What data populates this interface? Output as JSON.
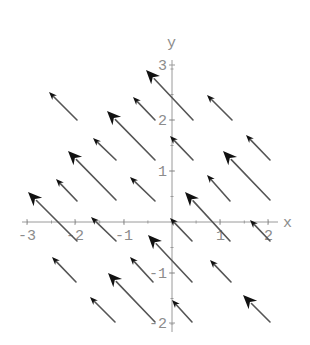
{
  "chart_data": {
    "type": "vector_field",
    "title": "",
    "xlabel": "x",
    "ylabel": "y",
    "xlim": [
      -3,
      2
    ],
    "ylim": [
      -2,
      3
    ],
    "xticks": [
      -3,
      -2,
      -1,
      1,
      2
    ],
    "yticks": [
      -2,
      -1,
      1,
      2,
      3
    ],
    "xtick_labels": [
      "-3",
      "-2",
      "-1",
      "1",
      "2"
    ],
    "ytick_labels": [
      "-2",
      "-1",
      "1",
      "2",
      "3"
    ],
    "grid": false,
    "legend": null,
    "direction": "all vectors point up-left (approx. -1, +1)",
    "arrows_px": [
      {
        "head": [
          49,
          92
        ],
        "tail": [
          77,
          120
        ],
        "size": "small"
      },
      {
        "head": [
          133,
          97
        ],
        "tail": [
          155,
          120
        ],
        "size": "small"
      },
      {
        "head": [
          146,
          70
        ],
        "tail": [
          193,
          120
        ],
        "size": "large"
      },
      {
        "head": [
          207,
          95
        ],
        "tail": [
          232,
          120
        ],
        "size": "small"
      },
      {
        "head": [
          107,
          111
        ],
        "tail": [
          155,
          160
        ],
        "size": "large"
      },
      {
        "head": [
          93,
          138
        ],
        "tail": [
          116,
          160
        ],
        "size": "small"
      },
      {
        "head": [
          170,
          136
        ],
        "tail": [
          193,
          160
        ],
        "size": "small"
      },
      {
        "head": [
          246,
          135
        ],
        "tail": [
          270,
          160
        ],
        "size": "small"
      },
      {
        "head": [
          68,
          151
        ],
        "tail": [
          116,
          200
        ],
        "size": "large"
      },
      {
        "head": [
          223,
          151
        ],
        "tail": [
          270,
          200
        ],
        "size": "large"
      },
      {
        "head": [
          56,
          179
        ],
        "tail": [
          77,
          201
        ],
        "size": "small"
      },
      {
        "head": [
          130,
          177
        ],
        "tail": [
          155,
          201
        ],
        "size": "small"
      },
      {
        "head": [
          207,
          175
        ],
        "tail": [
          230,
          201
        ],
        "size": "small"
      },
      {
        "head": [
          28,
          192
        ],
        "tail": [
          77,
          241
        ],
        "size": "large"
      },
      {
        "head": [
          185,
          192
        ],
        "tail": [
          230,
          241
        ],
        "size": "large"
      },
      {
        "head": [
          91,
          217
        ],
        "tail": [
          116,
          241
        ],
        "size": "small"
      },
      {
        "head": [
          170,
          218
        ],
        "tail": [
          192,
          241
        ],
        "size": "small"
      },
      {
        "head": [
          250,
          220
        ],
        "tail": [
          270,
          241
        ],
        "size": "small"
      },
      {
        "head": [
          148,
          235
        ],
        "tail": [
          192,
          282
        ],
        "size": "large"
      },
      {
        "head": [
          52,
          257
        ],
        "tail": [
          76,
          282
        ],
        "size": "small"
      },
      {
        "head": [
          130,
          257
        ],
        "tail": [
          153,
          282
        ],
        "size": "small"
      },
      {
        "head": [
          210,
          260
        ],
        "tail": [
          231,
          282
        ],
        "size": "small"
      },
      {
        "head": [
          108,
          273
        ],
        "tail": [
          155,
          322
        ],
        "size": "large"
      },
      {
        "head": [
          90,
          297
        ],
        "tail": [
          115,
          322
        ],
        "size": "small"
      },
      {
        "head": [
          172,
          300
        ],
        "tail": [
          192,
          322
        ],
        "size": "small"
      },
      {
        "head": [
          243,
          295
        ],
        "tail": [
          270,
          322
        ],
        "size": "large"
      }
    ]
  },
  "axes": {
    "x_label": "x",
    "y_label": "y",
    "x_ticks": [
      {
        "label": "-3",
        "px": 27
      },
      {
        "label": "-2",
        "px": 75
      },
      {
        "label": "-1",
        "px": 124
      },
      {
        "label": "1",
        "px": 220
      },
      {
        "label": "2",
        "px": 268
      }
    ],
    "y_ticks": [
      {
        "label": "3",
        "py": 65
      },
      {
        "label": "2",
        "py": 120
      },
      {
        "label": "1",
        "py": 171
      },
      {
        "label": "-1",
        "py": 273
      },
      {
        "label": "-2",
        "py": 323
      }
    ]
  },
  "colors": {
    "axis": "#9a9a9a",
    "shaft": "#555555",
    "head": "#111111",
    "background": "#ffffff"
  }
}
